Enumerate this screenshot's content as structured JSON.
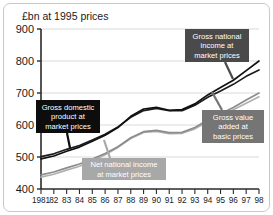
{
  "chart_data": {
    "type": "line",
    "title": "£bn at 1995 prices",
    "xlabel": "",
    "ylabel": "£bn at 1995 prices",
    "xlim": [
      1981,
      1998
    ],
    "ylim": [
      400,
      900
    ],
    "ytick_labels": [
      "900",
      "800",
      "700",
      "600",
      "500",
      "400"
    ],
    "ytick_values": [
      900,
      800,
      700,
      600,
      500,
      400
    ],
    "xtick_labels": [
      "1981",
      "82",
      "83",
      "84",
      "85",
      "86",
      "87",
      "88",
      "89",
      "90",
      "91",
      "92",
      "93",
      "94",
      "95",
      "96",
      "97",
      "98"
    ],
    "x": [
      1981,
      1982,
      1983,
      1984,
      1985,
      1986,
      1987,
      1988,
      1989,
      1990,
      1991,
      1992,
      1993,
      1994,
      1995,
      1996,
      1997,
      1998
    ],
    "grid": true,
    "legend_position": "annotations",
    "series": [
      {
        "name": "Gross domestic product at market prices",
        "color": "#1c1c1c",
        "values": [
          501,
          510,
          524,
          536,
          553,
          571,
          594,
          624,
          645,
          652,
          645,
          645,
          662,
          687,
          706,
          727,
          752,
          772
        ]
      },
      {
        "name": "Gross national income at market prices",
        "color": "#111111",
        "values": [
          494,
          503,
          518,
          531,
          549,
          568,
          592,
          627,
          650,
          655,
          646,
          648,
          666,
          694,
          717,
          740,
          770,
          800
        ]
      },
      {
        "name": "Gross value added at basic prices",
        "color": "#8c8c8c",
        "values": [
          444,
          453,
          466,
          478,
          494,
          511,
          532,
          560,
          579,
          583,
          576,
          577,
          592,
          616,
          635,
          655,
          678,
          700
        ]
      },
      {
        "name": "Net national income at market prices",
        "color": "#b0b0b0",
        "values": [
          437,
          446,
          459,
          471,
          488,
          507,
          530,
          558,
          577,
          580,
          573,
          574,
          588,
          610,
          628,
          648,
          668,
          688
        ]
      }
    ],
    "annotations": [
      {
        "id": "gdp",
        "lines": [
          "Gross domestic",
          "product at",
          "market prices"
        ],
        "box_color": "#0d0d0d",
        "text_color": "#ffffff"
      },
      {
        "id": "gni",
        "lines": [
          "Gross national",
          "income at",
          "market prices"
        ],
        "box_color": "#4a4a4a",
        "text_color": "#ffffff"
      },
      {
        "id": "gva",
        "lines": [
          "Gross value",
          "added at",
          "basic prices"
        ],
        "box_color": "#757575",
        "text_color": "#ffffff"
      },
      {
        "id": "nni",
        "lines": [
          "Net national income",
          "at market prices"
        ],
        "box_color": "#a8a8a8",
        "text_color": "#ffffff"
      }
    ]
  }
}
